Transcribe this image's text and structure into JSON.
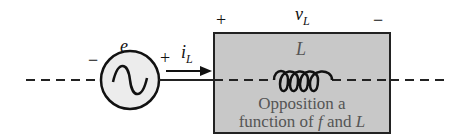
{
  "source": {
    "label": "e",
    "minus": "−",
    "plus": "+"
  },
  "current": {
    "label": "i",
    "subscript": "L"
  },
  "voltage": {
    "plus": "+",
    "label": "v",
    "subscript": "L",
    "minus": "−"
  },
  "inductor_box": {
    "symbol": "L",
    "caption_line1": "Opposition a",
    "caption_line2_pre": "function of ",
    "caption_line2_f": "f",
    "caption_line2_post": " and ",
    "caption_line2_L": "L",
    "fill_color": "#c8c8c8"
  }
}
